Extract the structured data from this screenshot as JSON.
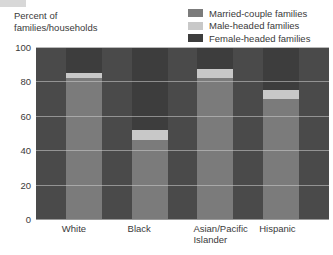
{
  "chart_data": {
    "type": "bar",
    "subtype": "stacked-bar-100",
    "title": "",
    "subtitle": "",
    "xlabel": "",
    "ylabel": "Percent of\nfamilies/households",
    "ylim": [
      0,
      100
    ],
    "yticks": [
      0,
      20,
      40,
      60,
      80,
      100
    ],
    "ytick_labels": [
      "0",
      "20",
      "40",
      "60",
      "80",
      "100"
    ],
    "grid": true,
    "legend_position": "top-right",
    "categories": [
      "White",
      "Black",
      "Asian/Pacific\nIslander",
      "Hispanic"
    ],
    "category_labels_flat": [
      "White",
      "Black",
      "Asian/Pacific Islander",
      "Hispanic"
    ],
    "series": [
      {
        "name": "Married-couple families",
        "color": "#7b7b7b",
        "values": [
          82,
          46,
          82,
          70
        ]
      },
      {
        "name": "Male-headed families",
        "color": "#c8c8c8",
        "values": [
          3,
          6,
          5,
          5
        ]
      },
      {
        "name": "Female-headed families",
        "color": "#3d3d3d",
        "values": [
          15,
          48,
          13,
          25
        ]
      }
    ],
    "plot_background": "#4a4a4a",
    "annotations": []
  },
  "legend": {
    "items": [
      {
        "label": "Married-couple families",
        "color": "#7b7b7b"
      },
      {
        "label": "Male-headed families",
        "color": "#c8c8c8"
      },
      {
        "label": "Female-headed families",
        "color": "#3d3d3d"
      }
    ]
  },
  "axis": {
    "y_caption": "Percent of\nfamilies/households",
    "y_labels": [
      "100",
      "80",
      "60",
      "40",
      "20",
      "0"
    ],
    "x_labels": [
      "White",
      "Black",
      "Asian/Pacific\nIslander",
      "Hispanic"
    ]
  }
}
